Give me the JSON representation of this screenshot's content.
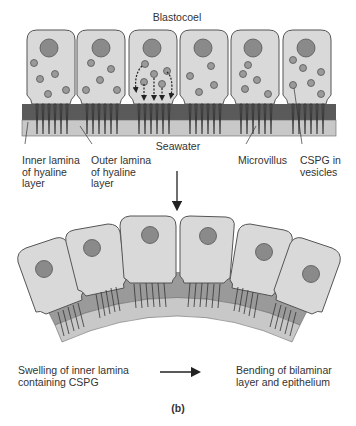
{
  "figure": {
    "panel_label": "(b)",
    "top_diagram": {
      "title_label": "Blastocoel",
      "bottom_label": "Seawater",
      "labels": {
        "inner_lamina": [
          "Inner lamina",
          "of hyaline",
          "layer"
        ],
        "outer_lamina": [
          "Outer lamina",
          "of hyaline",
          "layer"
        ],
        "microvillus": "Microvillus",
        "cspg": [
          "CSPG in",
          "vesicles"
        ]
      },
      "cell_count": 6
    },
    "transition_arrow": "down-arrow",
    "bottom_diagram": {
      "cell_count": 6,
      "shape": "curved epithelium (bent)"
    },
    "caption": {
      "cause": [
        "Swelling of inner lamina",
        "containing CSPG"
      ],
      "arrow": "right-arrow",
      "effect": [
        "Bending of bilaminar",
        "layer and epithelium"
      ]
    },
    "colors": {
      "cell_fill": "#d9d9d9",
      "cell_outline": "#555555",
      "nucleus": "#8a8a8a",
      "vesicle": "#8f8f8f",
      "inner_lamina": "#5a5a5a",
      "outer_lamina": "#c8c8c8",
      "microvillus": "#444444"
    }
  }
}
